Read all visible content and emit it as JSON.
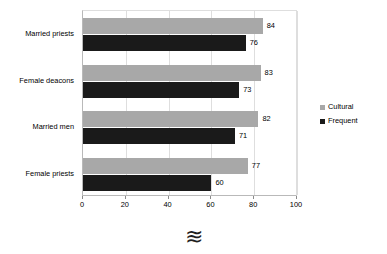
{
  "chart_data": {
    "type": "bar",
    "orientation": "horizontal",
    "title": "",
    "xlabel": "",
    "ylabel": "",
    "categories": [
      "Married priests",
      "Female deacons",
      "Married men",
      "Female priests"
    ],
    "series": [
      {
        "name": "Cultural",
        "color": "#a8a8a8",
        "values": [
          84,
          83,
          82,
          77
        ]
      },
      {
        "name": "Frequent",
        "color": "#1a1a1a",
        "values": [
          76,
          73,
          71,
          60
        ]
      }
    ],
    "xlim": [
      0,
      100
    ],
    "xticks": [
      0,
      20,
      40,
      60,
      80,
      100
    ],
    "xtick_labels": [
      "0",
      "20",
      "40",
      "60",
      "80",
      "100"
    ],
    "grid": true,
    "grid_axis": "x",
    "legend_position": "right",
    "data_labels": true
  },
  "legend": {
    "items": [
      {
        "label": "Cultural",
        "color": "#a8a8a8"
      },
      {
        "label": "Frequent",
        "color": "#1a1a1a"
      }
    ]
  },
  "annotations": {
    "bottom_mark": "≋"
  }
}
